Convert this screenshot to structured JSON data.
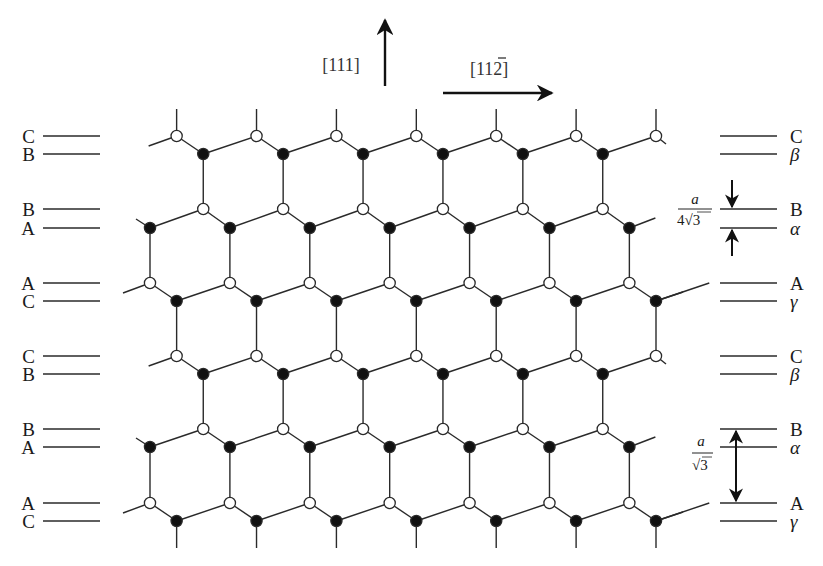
{
  "figure": {
    "directions": {
      "vertical_label": "[111]",
      "horizontal_label_prefix": "[11",
      "horizontal_label_bar_digit": "2",
      "horizontal_label_suffix": "]"
    },
    "left_layer_labels": [
      "C",
      "B",
      "B",
      "A",
      "A",
      "C",
      "C",
      "B",
      "B",
      "A",
      "A",
      "C"
    ],
    "right_layer_labels": [
      "C",
      "β",
      "B",
      "α",
      "A",
      "γ",
      "C",
      "β",
      "B",
      "α",
      "A",
      "γ"
    ],
    "layer_y": [
      136,
      154,
      209,
      228,
      283,
      301,
      356,
      374,
      429,
      447,
      503,
      521
    ],
    "annotations": {
      "small_gap": {
        "numerator": "a",
        "denominator_prefix": "4",
        "denominator_radicand": "3"
      },
      "large_gap": {
        "numerator": "a",
        "denominator_radicand": "3"
      }
    },
    "legend": {
      "open_circle": "open-atom",
      "filled_circle": "filled-atom"
    },
    "colors": {
      "line": "#2a2a2a",
      "atom_fill": "#111111",
      "open_fill": "#ffffff"
    }
  }
}
